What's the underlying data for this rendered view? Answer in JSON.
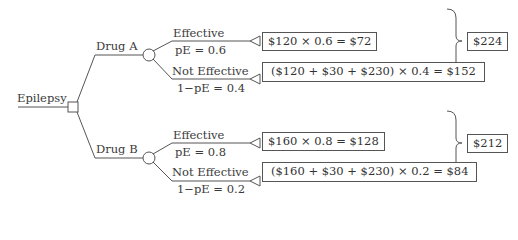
{
  "root": {
    "label": "Epilepsy",
    "node_type": "decision-square"
  },
  "branches": [
    {
      "label": "Drug A",
      "node_type": "chance-circle",
      "outcomes": [
        {
          "label": "Effective",
          "prob_label": "pE = 0.6",
          "calc": "$120 × 0.6 = $72"
        },
        {
          "label": "Not Effective",
          "prob_label": "1−pE = 0.4",
          "calc": "($120 + $30 + $230) × 0.4 = $152"
        }
      ],
      "total": "$224"
    },
    {
      "label": "Drug B",
      "node_type": "chance-circle",
      "outcomes": [
        {
          "label": "Effective",
          "prob_label": "pE = 0.8",
          "calc": "$160 × 0.8 = $128"
        },
        {
          "label": "Not Effective",
          "prob_label": "1−pE = 0.2",
          "calc": "($160 + $30 + $230) × 0.2 = $84"
        }
      ],
      "total": "$212"
    }
  ],
  "colors": {
    "line": "#555555",
    "text": "#333333",
    "background": "#ffffff"
  }
}
